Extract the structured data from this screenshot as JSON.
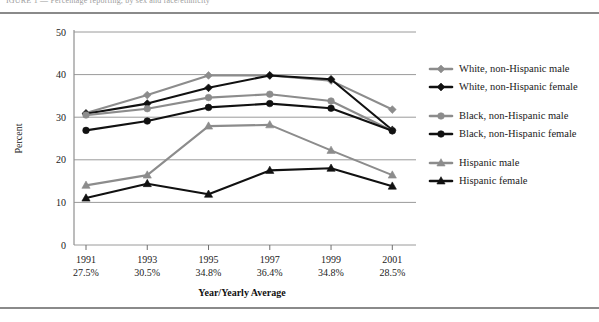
{
  "figure": {
    "clipped_header": "IGURE 1 — Percentage reporting, by sex and race/ethnicity",
    "top_rule": "horizontal-rule",
    "bottom_rule": "horizontal-rule"
  },
  "axes": {
    "y_label": "Percent",
    "x_label": "Year/Yearly Average",
    "y_ticks": [
      "0",
      "10",
      "20",
      "30",
      "40",
      "50"
    ],
    "x_tick_years": [
      "1991",
      "1993",
      "1995",
      "1997",
      "1999",
      "2001"
    ],
    "x_tick_averages": [
      "27.5%",
      "30.5%",
      "34.8%",
      "36.4%",
      "34.8%",
      "28.5%"
    ]
  },
  "legend": {
    "entries": [
      {
        "label": "White, non-Hispanic male",
        "color": "#8c8c8c",
        "marker": "diamond"
      },
      {
        "label": "White, non-Hispanic female",
        "color": "#111111",
        "marker": "diamond"
      },
      {
        "label": "Black, non-Hispanic male",
        "color": "#8c8c8c",
        "marker": "circle"
      },
      {
        "label": "Black, non-Hispanic female",
        "color": "#111111",
        "marker": "circle"
      },
      {
        "label": "Hispanic male",
        "color": "#8c8c8c",
        "marker": "triangle"
      },
      {
        "label": "Hispanic female",
        "color": "#111111",
        "marker": "triangle"
      }
    ]
  },
  "chart_data": {
    "type": "line",
    "title": "",
    "xlabel": "Year/Yearly Average",
    "ylabel": "Percent",
    "ylim": [
      0,
      50
    ],
    "ytick_step": 10,
    "grid": true,
    "legend_position": "right",
    "categories": [
      "1991",
      "1993",
      "1995",
      "1997",
      "1999",
      "2001"
    ],
    "category_sublabels": [
      "27.5%",
      "30.5%",
      "34.8%",
      "36.4%",
      "34.8%",
      "28.5%"
    ],
    "series": [
      {
        "name": "White, non-Hispanic male",
        "color": "#8c8c8c",
        "marker": "diamond",
        "values": [
          31.0,
          35.2,
          39.8,
          39.8,
          38.6,
          31.8
        ]
      },
      {
        "name": "White, non-Hispanic female",
        "color": "#111111",
        "marker": "diamond",
        "values": [
          30.8,
          33.2,
          36.9,
          39.8,
          38.9,
          27.0
        ]
      },
      {
        "name": "Black, non-Hispanic male",
        "color": "#8c8c8c",
        "marker": "circle",
        "values": [
          30.5,
          32.0,
          34.6,
          35.4,
          33.8,
          26.8
        ]
      },
      {
        "name": "Black, non-Hispanic female",
        "color": "#111111",
        "marker": "circle",
        "values": [
          26.9,
          29.1,
          32.3,
          33.2,
          32.1,
          26.8
        ]
      },
      {
        "name": "Hispanic male",
        "color": "#8c8c8c",
        "marker": "triangle",
        "values": [
          14.0,
          16.4,
          27.9,
          28.2,
          22.2,
          16.4
        ]
      },
      {
        "name": "Hispanic female",
        "color": "#111111",
        "marker": "triangle",
        "values": [
          11.0,
          14.4,
          11.9,
          17.5,
          18.0,
          13.8
        ]
      }
    ]
  },
  "layout": {
    "plot_left": 72,
    "plot_right": 412,
    "plot_top": 18,
    "plot_bottom": 231,
    "legend_x": 430,
    "legend_y_start": 55
  }
}
